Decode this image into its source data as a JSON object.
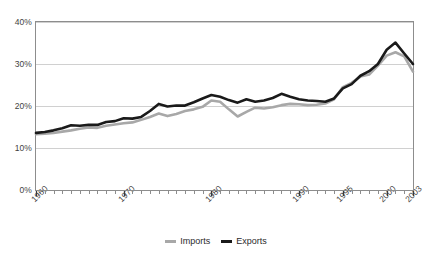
{
  "chart_data": {
    "type": "line",
    "title": "",
    "xlabel": "",
    "ylabel": "",
    "ylim": [
      0,
      40
    ],
    "xlim": [
      1960,
      2003
    ],
    "grid": true,
    "legend_position": "bottom-center",
    "ytick_labels": [
      "40%",
      "30%",
      "20%",
      "10%",
      "0%"
    ],
    "ytick_values": [
      40,
      30,
      20,
      10,
      0
    ],
    "xtick_labels": [
      "1960",
      "1970",
      "1980",
      "1990",
      "1995",
      "2000",
      "2003"
    ],
    "xtick_values": [
      1960,
      1970,
      1980,
      1990,
      1995,
      2000,
      2003
    ],
    "minor_xticks_interval": 1,
    "x": [
      1960,
      1961,
      1962,
      1963,
      1964,
      1965,
      1966,
      1967,
      1968,
      1969,
      1970,
      1971,
      1972,
      1973,
      1974,
      1975,
      1976,
      1977,
      1978,
      1979,
      1980,
      1981,
      1982,
      1983,
      1984,
      1985,
      1986,
      1987,
      1988,
      1989,
      1990,
      1991,
      1992,
      1993,
      1994,
      1995,
      1996,
      1997,
      1998,
      1999,
      2000,
      2001,
      2002,
      2003
    ],
    "series": [
      {
        "name": "Imports",
        "color": "#a8a8a8",
        "values": [
          13.3,
          13.4,
          13.6,
          13.9,
          14.2,
          14.6,
          14.9,
          14.8,
          15.3,
          15.6,
          15.9,
          16.1,
          16.7,
          17.4,
          18.2,
          17.6,
          18.1,
          18.8,
          19.2,
          19.8,
          21.3,
          21.0,
          19.2,
          17.5,
          18.6,
          19.6,
          19.4,
          19.7,
          20.2,
          20.5,
          20.4,
          20.2,
          20.3,
          20.6,
          21.6,
          24.5,
          25.5,
          27.0,
          27.5,
          29.6,
          32.0,
          32.8,
          31.8,
          28.2
        ]
      },
      {
        "name": "Exports",
        "color": "#1a1a1a",
        "values": [
          13.6,
          13.8,
          14.2,
          14.7,
          15.4,
          15.3,
          15.5,
          15.5,
          16.2,
          16.4,
          17.1,
          17.0,
          17.4,
          18.8,
          20.5,
          19.9,
          20.1,
          20.1,
          20.9,
          21.8,
          22.6,
          22.2,
          21.4,
          20.8,
          21.6,
          21.0,
          21.3,
          21.9,
          22.9,
          22.2,
          21.6,
          21.3,
          21.2,
          21.0,
          21.8,
          24.2,
          25.2,
          27.2,
          28.3,
          30.0,
          33.4,
          35.1,
          32.5,
          30.0
        ]
      }
    ]
  },
  "legend": {
    "items": [
      {
        "label": "Imports",
        "color": "#a8a8a8"
      },
      {
        "label": "Exports",
        "color": "#1a1a1a"
      }
    ]
  },
  "axis": {
    "y_labels": [
      "40%",
      "30%",
      "20%",
      "10%",
      "0%"
    ],
    "x_labels": [
      "1960",
      "1970",
      "1980",
      "1990",
      "1995",
      "2000",
      "2003"
    ]
  }
}
